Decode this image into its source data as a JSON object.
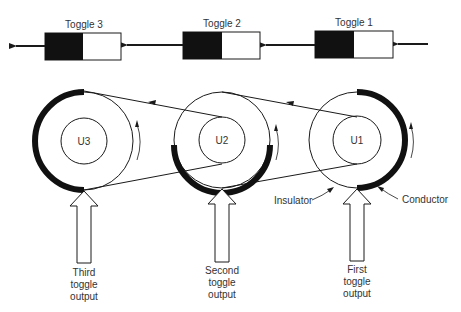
{
  "toggles": [
    {
      "label": "Toggle 3"
    },
    {
      "label": "Toggle 2"
    },
    {
      "label": "Toggle 1"
    }
  ],
  "units": [
    {
      "label": "U3"
    },
    {
      "label": "U2"
    },
    {
      "label": "U1"
    }
  ],
  "outputs": [
    {
      "line1": "Third",
      "line2": "toggle",
      "line3": "output"
    },
    {
      "line1": "Second",
      "line2": "toggle",
      "line3": "output"
    },
    {
      "line1": "First",
      "line2": "toggle",
      "line3": "output"
    }
  ],
  "callouts": {
    "insulator": "Insulator",
    "conductor": "Conductor"
  },
  "colors": {
    "ink": "#1a1a1a",
    "conductor": "#111111",
    "background": "#ffffff"
  }
}
